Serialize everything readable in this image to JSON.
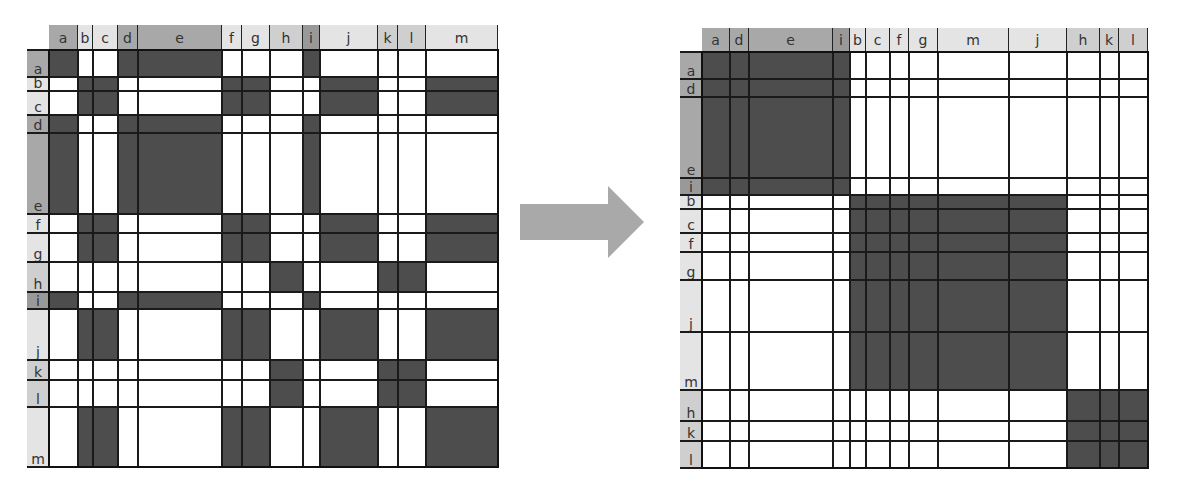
{
  "diagram": {
    "type": "matrix-reordering",
    "description_labels": {
      "arrow": "reorder"
    },
    "colors": {
      "filled": "#4d4d4d",
      "empty": "#ffffff",
      "grid": "#1a1a1a",
      "arrow": "#a9a9a9",
      "header_group1": "#a8a8a8",
      "header_i": "#999999",
      "header_group2": "#e4e4e4",
      "header_group3": "#cfcfcf"
    },
    "clusters": [
      [
        "a",
        "d",
        "e",
        "i"
      ],
      [
        "b",
        "c",
        "f",
        "g",
        "j",
        "m"
      ],
      [
        "h",
        "k",
        "l"
      ]
    ],
    "left_matrix": {
      "columns": [
        "a",
        "b",
        "c",
        "d",
        "e",
        "f",
        "g",
        "h",
        "i",
        "j",
        "k",
        "l",
        "m"
      ],
      "rows": [
        "a",
        "b",
        "c",
        "d",
        "e",
        "f",
        "g",
        "h",
        "i",
        "j",
        "k",
        "l",
        "m"
      ],
      "col_edges": [
        49,
        78,
        93,
        118,
        138,
        222,
        242,
        270,
        303,
        320,
        378,
        398,
        426,
        498
      ],
      "row_edges": [
        50,
        77,
        91,
        115,
        133,
        214,
        233,
        262,
        292,
        309,
        360,
        380,
        407,
        467
      ],
      "header_top": 25,
      "label_left": 27
    },
    "right_matrix": {
      "columns": [
        "a",
        "d",
        "e",
        "i",
        "b",
        "c",
        "f",
        "g",
        "m",
        "j",
        "h",
        "k",
        "l"
      ],
      "rows": [
        "a",
        "d",
        "e",
        "i",
        "b",
        "c",
        "f",
        "g",
        "j",
        "m",
        "h",
        "k",
        "l"
      ],
      "col_edges": [
        702,
        730,
        749,
        833,
        850,
        866,
        890,
        909,
        938,
        1009,
        1067,
        1100,
        1119,
        1148
      ],
      "row_edges": [
        52,
        79,
        97,
        178,
        195,
        209,
        233,
        252,
        280,
        332,
        390,
        421,
        441,
        468
      ],
      "header_top": 28,
      "label_left": 680
    }
  }
}
